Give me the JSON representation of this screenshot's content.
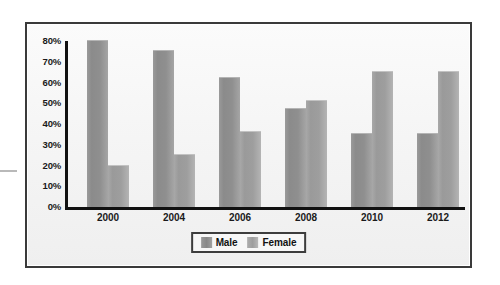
{
  "chart_data": {
    "type": "bar",
    "title": "",
    "subtitle": "",
    "xlabel": "",
    "ylabel": "",
    "categories": [
      "2000",
      "2004",
      "2006",
      "2008",
      "2010",
      "2012"
    ],
    "series": [
      {
        "name": "Male",
        "values": [
          80,
          75,
          62,
          47,
          35,
          35
        ]
      },
      {
        "name": "Female",
        "values": [
          20,
          25,
          36,
          51,
          65,
          65
        ]
      }
    ],
    "ylim": [
      0,
      80
    ],
    "ytick_values": [
      0,
      10,
      20,
      30,
      40,
      50,
      60,
      70,
      80
    ],
    "ytick_labels": [
      "0%",
      "10%",
      "20%",
      "30%",
      "40%",
      "50%",
      "60%",
      "70%",
      "80%"
    ],
    "grid": false,
    "legend_position": "bottom-center",
    "legend_entries": [
      "Male",
      "Female"
    ],
    "colors": {
      "male": "#8f8f8f",
      "female": "#9e9e9e",
      "axis": "#111111",
      "frame": "#3a3a3a",
      "plot_background": "#f6f6f6",
      "text": "#1a1a1a"
    }
  }
}
